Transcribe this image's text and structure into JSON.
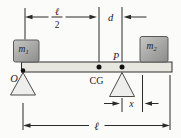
{
  "figure": {
    "background": "#fbfbf9",
    "colors": {
      "beam_fill": "#e8e7df",
      "beam_stroke": "#2e2e2e",
      "block_fill_light": "#c7c7c5",
      "block_fill_dark": "#8c8c8a",
      "block_stroke": "#5a5a58",
      "support_fill": "#eeeeec",
      "support_stroke": "#4a4a4a",
      "line_color": "#2b2b2b",
      "dot_color": "#111111"
    },
    "labels": {
      "mass1": {
        "base": "m",
        "sub": "1"
      },
      "mass2": {
        "base": "m",
        "sub": "2"
      },
      "origin": "O",
      "center_of_gravity": "CG",
      "pivot": "P",
      "dim_half_numerator": "ℓ",
      "dim_half_denominator": "2",
      "dim_d": "d",
      "dim_x": "x",
      "dim_length": "ℓ"
    }
  }
}
